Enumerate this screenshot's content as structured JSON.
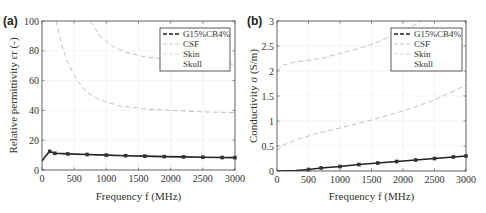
{
  "chart_data": [
    {
      "panel": "(a)",
      "type": "line",
      "title": "",
      "xlabel": "Frequency f (MHz)",
      "ylabel": "Relative permittivity εr (-)",
      "xlim": [
        0,
        3000
      ],
      "ylim": [
        0,
        100
      ],
      "xticks": [
        0,
        500,
        1000,
        1500,
        2000,
        2500,
        3000
      ],
      "yticks": [
        0,
        20,
        40,
        60,
        80,
        100
      ],
      "grid": true,
      "legend_position": "upper right",
      "series": [
        {
          "name": "G15%CB4%",
          "style": "dashed-markers",
          "color": "#222222",
          "x": [
            0,
            50,
            120,
            200,
            400,
            700,
            1000,
            1300,
            1600,
            1900,
            2200,
            2500,
            2800,
            3000
          ],
          "y": [
            6,
            9,
            12.5,
            11.2,
            10.8,
            10.4,
            10.0,
            9.6,
            9.3,
            9.0,
            8.8,
            8.6,
            8.4,
            8.3
          ]
        },
        {
          "name": "CSF",
          "style": "dashed",
          "color": "#bbbbbb",
          "x": [
            750,
            900,
            1100,
            1300,
            1600,
            2000,
            2400,
            2700,
            3000
          ],
          "y": [
            100,
            90,
            83,
            79,
            76,
            74,
            72.5,
            71.5,
            71
          ]
        },
        {
          "name": "Skin",
          "style": "dashed",
          "color": "#bbbbbb",
          "x": [
            220,
            300,
            400,
            550,
            700,
            900,
            1200,
            1600,
            2000,
            2500,
            3000
          ],
          "y": [
            100,
            85,
            72,
            60,
            52,
            47,
            43,
            41,
            40,
            39,
            38.5
          ]
        },
        {
          "name": "Skull",
          "style": "dotted",
          "color": "#dddddd",
          "x": [],
          "y": []
        }
      ]
    },
    {
      "panel": "(b)",
      "type": "line",
      "title": "",
      "xlabel": "Frequency f (MHz)",
      "ylabel": "Conductivity σ (S/m)",
      "xlim": [
        0,
        3000
      ],
      "ylim": [
        0,
        3
      ],
      "xticks": [
        0,
        500,
        1000,
        1500,
        2000,
        2500,
        3000
      ],
      "yticks": [
        0,
        0.5,
        1,
        1.5,
        2,
        2.5,
        3
      ],
      "grid": true,
      "legend_position": "upper right",
      "series": [
        {
          "name": "G15%CB4%",
          "style": "dashed-markers",
          "color": "#222222",
          "x": [
            0,
            300,
            500,
            700,
            1000,
            1300,
            1600,
            1900,
            2200,
            2500,
            2800,
            3000
          ],
          "y": [
            0,
            0.01,
            0.03,
            0.06,
            0.09,
            0.13,
            0.16,
            0.19,
            0.22,
            0.25,
            0.28,
            0.3
          ]
        },
        {
          "name": "CSF",
          "style": "dashed",
          "color": "#bbbbbb",
          "x": [
            0,
            100,
            300,
            700,
            1000,
            1300,
            1600,
            2000,
            2300
          ],
          "y": [
            2.0,
            2.12,
            2.18,
            2.25,
            2.35,
            2.45,
            2.58,
            2.8,
            3.0
          ]
        },
        {
          "name": "Skin",
          "style": "dashed",
          "color": "#bbbbbb",
          "x": [
            0,
            100,
            300,
            600,
            1000,
            1500,
            2000,
            2500,
            3000
          ],
          "y": [
            0.4,
            0.52,
            0.62,
            0.74,
            0.86,
            1.02,
            1.2,
            1.42,
            1.72
          ]
        },
        {
          "name": "Skull",
          "style": "dotted",
          "color": "#dddddd",
          "x": [],
          "y": []
        }
      ]
    }
  ],
  "panels": {
    "a": {
      "label": "(a)",
      "ylabel_text": "Relative permittivity εr (-)",
      "xlabel_text": "Frequency f (MHz)",
      "xtick_labels": [
        "0",
        "500",
        "1000",
        "1500",
        "2000",
        "2500",
        "3000"
      ],
      "ytick_labels": [
        "0",
        "20",
        "40",
        "60",
        "80",
        "100"
      ],
      "legend": [
        "G15%CB4%",
        "CSF",
        "Skin",
        "Skull"
      ]
    },
    "b": {
      "label": "(b)",
      "ylabel_text": "Conductivity σ (S/m)",
      "xlabel_text": "Frequency f (MHz)",
      "xtick_labels": [
        "0",
        "500",
        "1000",
        "1500",
        "2000",
        "2500",
        "3000"
      ],
      "ytick_labels": [
        "0",
        "0.5",
        "1",
        "1.5",
        "2",
        "2.5",
        "3"
      ],
      "legend": [
        "G15%CB4%",
        "CSF",
        "Skin",
        "Skull"
      ]
    }
  }
}
